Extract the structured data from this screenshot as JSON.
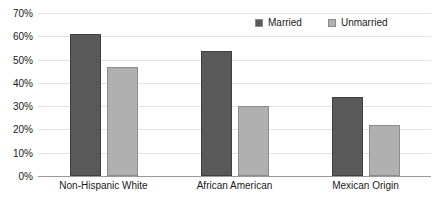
{
  "chart_data": {
    "type": "bar",
    "title": "",
    "subtitle": "",
    "xlabel": "",
    "ylabel": "",
    "categories": [
      "Non-Hispanic White",
      "African American",
      "Mexican Origin"
    ],
    "series": [
      {
        "name": "Married",
        "color": "#595959",
        "values": [
          61,
          53.5,
          34
        ]
      },
      {
        "name": "Unmarried",
        "color": "#b0b0b0",
        "values": [
          47,
          30,
          22
        ]
      }
    ],
    "ylim": [
      0,
      70
    ],
    "ytick_step": 10,
    "ytick_labels": [
      "70%",
      "60%",
      "50%",
      "40%",
      "30%",
      "20%",
      "10%",
      "0%"
    ],
    "ytick_values": [
      70,
      60,
      50,
      40,
      30,
      20,
      10,
      0
    ],
    "grid": true,
    "legend_position": "top-right"
  },
  "legend": {
    "entries": [
      {
        "label": "Married"
      },
      {
        "label": "Unmarried"
      }
    ]
  }
}
